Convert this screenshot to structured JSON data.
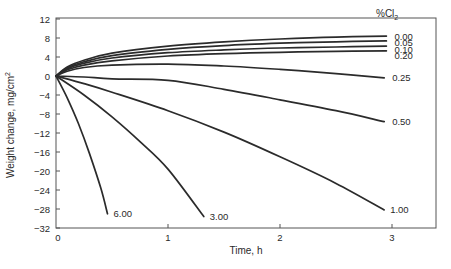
{
  "chart_data": {
    "type": "line",
    "title": "",
    "xlabel": "Time, h",
    "ylabel": "Weight change, mg/cm²",
    "ylabel_parts": {
      "main": "Weight change, mg/cm",
      "sup": "2"
    },
    "xlim": [
      0,
      3.4
    ],
    "ylim": [
      -32,
      12
    ],
    "x_ticks": [
      0,
      1,
      2,
      3
    ],
    "y_ticks": [
      12,
      8,
      4,
      0,
      -4,
      -8,
      -12,
      -16,
      -20,
      -24,
      -28,
      -32
    ],
    "y_tick_labels": [
      "12",
      "8",
      "4",
      "0",
      "−4",
      "−8",
      "−12",
      "−16",
      "−20",
      "−24",
      "−28",
      "−32"
    ],
    "grid": false,
    "legend": {
      "title": "%Cl",
      "title_sub": "2",
      "position": "right, inline labels at line ends"
    },
    "line_color": "#2b2b2b",
    "series": [
      {
        "name": "0.00",
        "x": [
          0,
          0.1,
          0.25,
          0.5,
          1.0,
          1.5,
          2.0,
          2.5,
          2.95
        ],
        "y": [
          0,
          1.9,
          3.3,
          4.8,
          6.3,
          7.2,
          7.8,
          8.2,
          8.4
        ]
      },
      {
        "name": "0.05",
        "x": [
          0,
          0.1,
          0.25,
          0.5,
          1.0,
          1.5,
          2.0,
          2.5,
          2.95
        ],
        "y": [
          0,
          1.7,
          3.0,
          4.3,
          5.6,
          6.4,
          6.9,
          7.2,
          7.4
        ]
      },
      {
        "name": "0.10",
        "x": [
          0,
          0.1,
          0.25,
          0.5,
          1.0,
          1.5,
          2.0,
          2.5,
          2.95
        ],
        "y": [
          0,
          1.5,
          2.7,
          3.8,
          4.9,
          5.5,
          5.9,
          6.1,
          6.3
        ]
      },
      {
        "name": "0.20",
        "x": [
          0,
          0.1,
          0.25,
          0.5,
          1.0,
          1.5,
          2.0,
          2.5,
          2.95
        ],
        "y": [
          0,
          1.3,
          2.3,
          3.2,
          4.2,
          4.7,
          5.0,
          5.2,
          5.3
        ]
      },
      {
        "name": "0.25",
        "x": [
          0,
          0.1,
          0.25,
          0.5,
          1.0,
          1.5,
          2.0,
          2.5,
          2.93
        ],
        "y": [
          0,
          1.0,
          1.8,
          2.3,
          2.5,
          2.1,
          1.4,
          0.5,
          -0.4
        ]
      },
      {
        "name": "0.50",
        "x": [
          0,
          0.25,
          0.5,
          1.0,
          1.5,
          2.0,
          2.5,
          2.93
        ],
        "y": [
          0,
          -0.2,
          -0.6,
          -0.9,
          -2.8,
          -5.0,
          -7.3,
          -9.6
        ]
      },
      {
        "name": "1.00",
        "x": [
          0,
          0.25,
          0.5,
          1.0,
          1.5,
          2.0,
          2.5,
          2.93
        ],
        "y": [
          0,
          -1.6,
          -3.4,
          -7.3,
          -11.8,
          -17.0,
          -22.6,
          -28.2
        ]
      },
      {
        "name": "3.00",
        "x": [
          0,
          0.25,
          0.5,
          0.75,
          1.0,
          1.32
        ],
        "y": [
          0,
          -4.0,
          -8.6,
          -13.8,
          -19.6,
          -29.6
        ]
      },
      {
        "name": "6.00",
        "x": [
          0,
          0.1,
          0.2,
          0.3,
          0.4,
          0.46
        ],
        "y": [
          0,
          -4.6,
          -10.0,
          -16.4,
          -23.6,
          -29.0
        ]
      }
    ],
    "label_offsets": {
      "0.00": [
        8,
        0
      ],
      "0.05": [
        8,
        2
      ],
      "0.10": [
        8,
        3
      ],
      "0.20": [
        8,
        5
      ],
      "0.25": [
        8,
        0
      ],
      "0.50": [
        8,
        0
      ],
      "1.00": [
        6,
        0
      ],
      "3.00": [
        6,
        0
      ],
      "6.00": [
        6,
        0
      ]
    }
  }
}
